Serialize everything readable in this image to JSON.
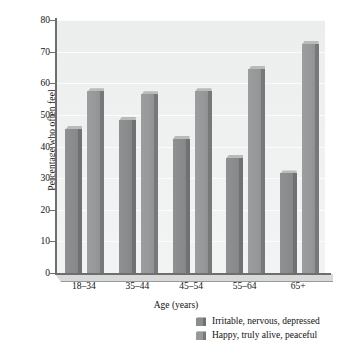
{
  "chart_data": {
    "type": "bar",
    "title": "",
    "subtitle": "",
    "xlabel": "Age (years)",
    "ylabel": "Percentage who often feel",
    "categories": [
      "18–34",
      "35–44",
      "45–54",
      "55–64",
      "65+"
    ],
    "series": [
      {
        "name": "Irritable, nervous, depressed",
        "color": "#8a8c8d",
        "values": [
          45.5,
          48.5,
          42.5,
          36.5,
          31.5
        ]
      },
      {
        "name": "Happy, truly alive, peaceful",
        "color": "#979999",
        "values": [
          57.5,
          56.5,
          57.5,
          64.5,
          72.5
        ]
      }
    ],
    "ylim": [
      0,
      80
    ],
    "yticks": [
      0,
      10,
      20,
      30,
      40,
      50,
      60,
      70,
      80
    ],
    "ytick_labels": [
      "0",
      "10",
      "20",
      "30",
      "40",
      "50",
      "60",
      "70",
      "80"
    ],
    "grid": true,
    "grid_axis": "y",
    "legend_position": "bottom-right",
    "legend_entries": [
      "Irritable, nervous, depressed",
      "Happy, truly alive, peaceful"
    ],
    "annotations": []
  }
}
